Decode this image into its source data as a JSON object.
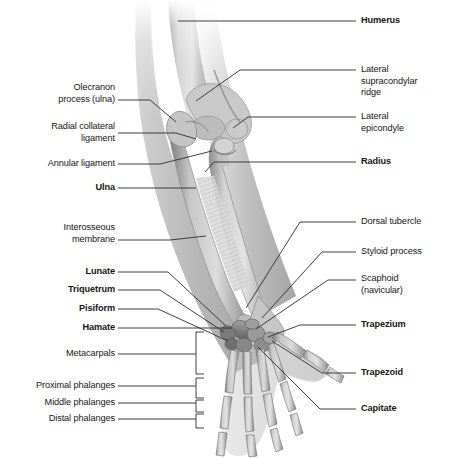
{
  "figure": {
    "background_color": "#ffffff",
    "line_color": "#2b2b2b",
    "text_color": "#161616",
    "bone_tone_light": "#d8d8d8",
    "bone_tone_mid": "#a8a8a8",
    "bone_tone_dark": "#6e6e6e"
  },
  "labels_right": [
    {
      "id": "humerus",
      "text": "Humerus",
      "bold": true,
      "x": 361,
      "y": 23
    },
    {
      "id": "lateral-supracondylar-ridge",
      "text": "Lateral\nsupracondylar\nridge",
      "bold": false,
      "x": 361,
      "y": 72
    },
    {
      "id": "lateral-epicondyle",
      "text": "Lateral\nepicondyle",
      "bold": false,
      "x": 361,
      "y": 119
    },
    {
      "id": "radius",
      "text": "Radius",
      "bold": true,
      "x": 361,
      "y": 164
    },
    {
      "id": "dorsal-tubercle",
      "text": "Dorsal tubercle",
      "bold": false,
      "x": 361,
      "y": 224
    },
    {
      "id": "styloid-process",
      "text": "Styloid process",
      "bold": false,
      "x": 361,
      "y": 254
    },
    {
      "id": "scaphoid-navicular",
      "text": "Scaphoid\n(navicular)",
      "bold": false,
      "x": 361,
      "y": 281
    },
    {
      "id": "trapezium",
      "text": "Trapezium",
      "bold": true,
      "x": 361,
      "y": 327
    },
    {
      "id": "trapezoid",
      "text": "Trapezoid",
      "bold": true,
      "x": 361,
      "y": 375
    },
    {
      "id": "capitate",
      "text": "Capitate",
      "bold": true,
      "x": 361,
      "y": 411
    }
  ],
  "labels_left": [
    {
      "id": "olecranon-process-ulna",
      "text": "Olecranon\nprocess (ulna)",
      "bold": false,
      "x": 115,
      "y": 84
    },
    {
      "id": "radial-collateral-ligament",
      "text": "Radial collateral\nligament",
      "bold": false,
      "x": 115,
      "y": 125
    },
    {
      "id": "annular-ligament",
      "text": "Annular ligament",
      "bold": false,
      "x": 115,
      "y": 160
    },
    {
      "id": "ulna",
      "text": "Ulna",
      "bold": true,
      "x": 115,
      "y": 190
    },
    {
      "id": "interosseous-membrane",
      "text": "Interosseous\nmembrane",
      "bold": false,
      "x": 115,
      "y": 225
    },
    {
      "id": "lunate",
      "text": "Lunate",
      "bold": true,
      "x": 115,
      "y": 268
    },
    {
      "id": "triquetrum",
      "text": "Triquetrum",
      "bold": true,
      "x": 115,
      "y": 286
    },
    {
      "id": "pisiform",
      "text": "Pisiform",
      "bold": true,
      "x": 115,
      "y": 305
    },
    {
      "id": "hamate",
      "text": "Hamate",
      "bold": true,
      "x": 115,
      "y": 324
    },
    {
      "id": "metacarpals",
      "text": "Metacarpals",
      "bold": false,
      "x": 115,
      "y": 350
    },
    {
      "id": "proximal-phalanges",
      "text": "Proximal phalanges",
      "bold": false,
      "x": 115,
      "y": 382
    },
    {
      "id": "middle-phalanges",
      "text": "Middle phalanges",
      "bold": false,
      "x": 115,
      "y": 399
    },
    {
      "id": "distal-phalanges",
      "text": "Distal phalanges",
      "bold": false,
      "x": 115,
      "y": 415
    }
  ],
  "brackets": [
    {
      "id": "metacarpals-bracket",
      "x": 196,
      "y_top": 332,
      "y_bottom": 374,
      "width": 8
    },
    {
      "id": "proximal-phalanges-bracket",
      "x": 196,
      "y_top": 378,
      "y_bottom": 398,
      "width": 8
    },
    {
      "id": "middle-phalanges-bracket",
      "x": 196,
      "y_top": 400,
      "y_bottom": 412,
      "width": 8
    },
    {
      "id": "distal-phalanges-bracket",
      "x": 196,
      "y_top": 414,
      "y_bottom": 428,
      "width": 8
    }
  ]
}
